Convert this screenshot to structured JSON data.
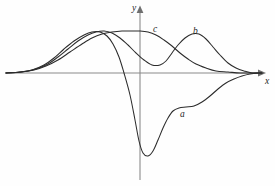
{
  "figure": {
    "title": "",
    "background_color": "#fefefe",
    "width": 275,
    "height": 186
  },
  "axes": {
    "x_label": "x",
    "y_label": "y",
    "x_axis_color": "#8a8a8a",
    "y_axis_color": "#8a8a8a",
    "x_axis_y_px": 73,
    "y_axis_x_px": 140,
    "x_range_px": [
      5,
      262
    ],
    "y_range_px": [
      8,
      180
    ],
    "arrows": [
      "x-right",
      "y-up"
    ],
    "ticks": [],
    "gridlines": false
  },
  "chart_data": {
    "type": "line",
    "title": "",
    "xlabel": "x",
    "ylabel": "y",
    "grid": false,
    "legend": "inline-curve-labels",
    "xlim": [
      -4.5,
      4.5
    ],
    "ylim": [
      -2.6,
      1.3
    ],
    "series": [
      {
        "name": "a",
        "label": "a",
        "color": "#2b2b2b",
        "description": "wavelet-like curve: broad positive bump left of origin, deep negative trough just right of origin, shallow negative dip, decays to zero",
        "label_position_px": [
          180,
          110
        ],
        "points_px": [
          [
            6,
            73
          ],
          [
            20,
            72
          ],
          [
            32,
            70
          ],
          [
            44,
            65
          ],
          [
            54,
            58
          ],
          [
            64,
            49
          ],
          [
            74,
            41
          ],
          [
            84,
            35
          ],
          [
            92,
            32
          ],
          [
            100,
            32
          ],
          [
            107,
            36
          ],
          [
            113,
            44
          ],
          [
            119,
            57
          ],
          [
            124,
            73
          ],
          [
            130,
            95
          ],
          [
            135,
            120
          ],
          [
            139,
            141
          ],
          [
            143,
            153
          ],
          [
            148,
            156
          ],
          [
            153,
            151
          ],
          [
            158,
            140
          ],
          [
            163,
            128
          ],
          [
            168,
            118
          ],
          [
            173,
            111
          ],
          [
            179,
            108
          ],
          [
            186,
            107
          ],
          [
            194,
            106
          ],
          [
            202,
            102
          ],
          [
            210,
            96
          ],
          [
            218,
            89
          ],
          [
            226,
            83
          ],
          [
            234,
            79
          ],
          [
            242,
            76
          ],
          [
            250,
            74
          ],
          [
            258,
            73
          ],
          [
            262,
            73
          ]
        ]
      },
      {
        "name": "b",
        "label": "b",
        "color": "#2b2b2b",
        "description": "asymmetric bump: rises from the far left along the axis, crosses through a wide hump on the left, dips near origin and peaks strongly to the right of the y-axis, then decays to zero",
        "label_position_px": [
          193,
          27
        ],
        "points_px": [
          [
            6,
            73
          ],
          [
            22,
            72
          ],
          [
            36,
            69
          ],
          [
            48,
            64
          ],
          [
            58,
            57
          ],
          [
            68,
            49
          ],
          [
            78,
            41
          ],
          [
            88,
            35
          ],
          [
            96,
            32
          ],
          [
            104,
            31
          ],
          [
            112,
            33
          ],
          [
            120,
            38
          ],
          [
            128,
            45
          ],
          [
            136,
            53
          ],
          [
            144,
            60
          ],
          [
            152,
            65
          ],
          [
            160,
            65
          ],
          [
            166,
            61
          ],
          [
            172,
            53
          ],
          [
            178,
            45
          ],
          [
            185,
            38
          ],
          [
            192,
            34
          ],
          [
            199,
            34
          ],
          [
            206,
            39
          ],
          [
            213,
            47
          ],
          [
            220,
            55
          ],
          [
            228,
            63
          ],
          [
            236,
            68
          ],
          [
            244,
            71
          ],
          [
            252,
            73
          ],
          [
            262,
            73
          ]
        ]
      },
      {
        "name": "c",
        "label": "c",
        "color": "#2b2b2b",
        "description": "broad single hump centered slightly left of the y-axis with the maximum near the origin, symmetric decay to zero at both ends",
        "label_position_px": [
          153,
          25
        ],
        "points_px": [
          [
            6,
            73
          ],
          [
            20,
            72
          ],
          [
            34,
            70
          ],
          [
            46,
            66
          ],
          [
            58,
            60
          ],
          [
            70,
            52
          ],
          [
            82,
            44
          ],
          [
            92,
            38
          ],
          [
            102,
            34
          ],
          [
            112,
            32
          ],
          [
            122,
            31
          ],
          [
            132,
            31
          ],
          [
            140,
            31
          ],
          [
            148,
            32
          ],
          [
            156,
            35
          ],
          [
            164,
            40
          ],
          [
            172,
            46
          ],
          [
            180,
            53
          ],
          [
            188,
            59
          ],
          [
            196,
            64
          ],
          [
            206,
            68
          ],
          [
            216,
            71
          ],
          [
            228,
            72
          ],
          [
            240,
            73
          ],
          [
            252,
            73
          ],
          [
            262,
            73
          ]
        ]
      }
    ]
  },
  "labels": {
    "curve_a": "a",
    "curve_b": "b",
    "curve_c": "c",
    "axis_x": "x",
    "axis_y": "y"
  }
}
